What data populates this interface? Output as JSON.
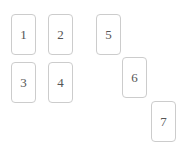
{
  "board": {
    "name": "card-board",
    "background_color": "#ffffff",
    "card_width": 25,
    "card_height": 41,
    "card_border_color": "#cccccc",
    "card_background_color": "#ffffff",
    "card_text_color": "#555555",
    "card_corner_radius": 4
  },
  "cards": [
    {
      "label": "1",
      "x": 11,
      "y": 14
    },
    {
      "label": "2",
      "x": 48,
      "y": 14
    },
    {
      "label": "3",
      "x": 11,
      "y": 62
    },
    {
      "label": "4",
      "x": 48,
      "y": 62
    },
    {
      "label": "5",
      "x": 96,
      "y": 14
    },
    {
      "label": "6",
      "x": 122,
      "y": 57
    },
    {
      "label": "7",
      "x": 151,
      "y": 101
    }
  ]
}
